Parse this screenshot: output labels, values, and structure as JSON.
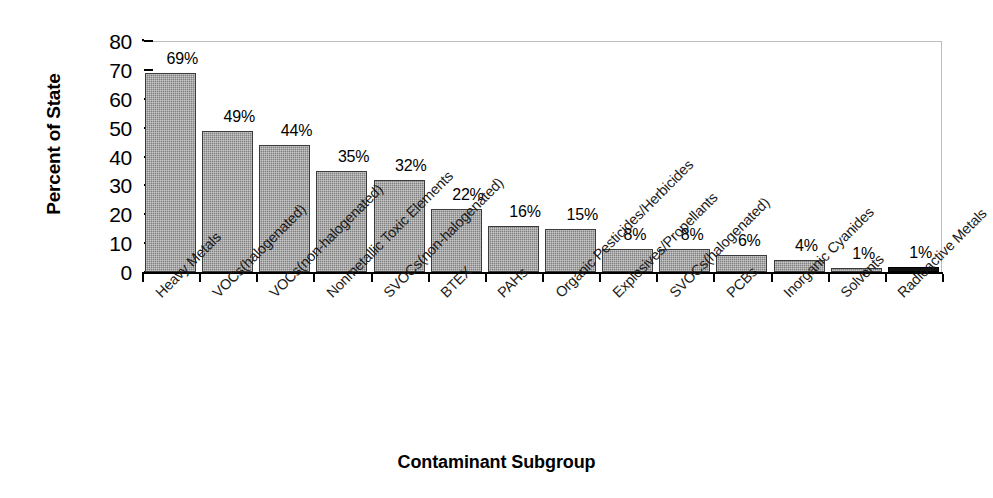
{
  "chart_data": {
    "type": "bar",
    "title": "",
    "xlabel": "Contaminant Subgroup",
    "ylabel": "Percent of State",
    "ylim": [
      0,
      80
    ],
    "ytick_step": 10,
    "yticks": [
      80,
      70,
      60,
      50,
      40,
      30,
      20,
      10,
      0
    ],
    "grid": false,
    "legend": "none",
    "value_label_suffix": "%",
    "categories": [
      "Heavy Metals",
      "VOCs(halogenated)",
      "VOCs(non-halogenated)",
      "Nonmetallic Toxic Elements",
      "SVOCs(non-halogenated)",
      "BTEX",
      "PAHs",
      "Organic Pesticides/Herbicides",
      "Explosives/Propellants",
      "SVOCs(halogenated)",
      "PCBs",
      "Inorganic Cyanides",
      "Solvents",
      "Radioactive Metals"
    ],
    "values": [
      69,
      49,
      44,
      35,
      32,
      22,
      16,
      15,
      8,
      8,
      6,
      4,
      1,
      1
    ],
    "value_labels": [
      "69%",
      "49%",
      "44%",
      "35%",
      "32%",
      "22%",
      "16%",
      "15%",
      "8%",
      "8%",
      "6%",
      "4%",
      "1%",
      "1%"
    ],
    "colors": {
      "bar_fill": "#808080",
      "bar_edge": "#3b3b3b",
      "last_bar_fill": "#111111",
      "axis": "#000000",
      "frame": "#bdbdbd",
      "text": "#000000",
      "background": "#ffffff"
    }
  }
}
